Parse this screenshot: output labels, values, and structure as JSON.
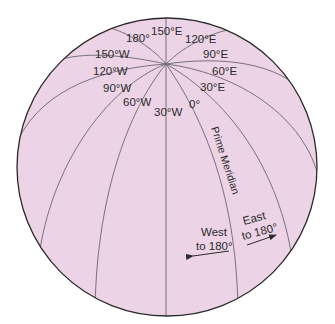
{
  "diagram": {
    "type": "globe-meridians",
    "colors": {
      "globe_fill": "#ecd3e6",
      "outline": "#2a2a2a",
      "meridian": "#6b6670",
      "text": "#2b2b2b"
    },
    "meridian_labels": {
      "m180": "180°",
      "m150e": "150°E",
      "m120e": "120°E",
      "m90e": "90°E",
      "m60e": "60°E",
      "m30e": "30°E",
      "m0": "0°",
      "m30w": "30°W",
      "m60w": "60°W",
      "m90w": "90°W",
      "m120w": "120°W",
      "m150w": "150°W"
    },
    "prime_meridian_label": "Prime Meridian",
    "west": {
      "line1": "West",
      "line2": "to 180°"
    },
    "east": {
      "line1": "East",
      "line2": "to 180°"
    }
  }
}
